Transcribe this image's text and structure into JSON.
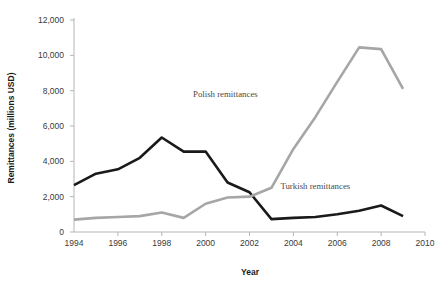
{
  "chart_data": {
    "type": "line",
    "title": "",
    "xlabel": "Year",
    "ylabel": "Remittances (millions USD)",
    "xlim": [
      1994,
      2010
    ],
    "ylim": [
      0,
      12000
    ],
    "xticks": [
      "1994",
      "1996",
      "1998",
      "2000",
      "2002",
      "2004",
      "2006",
      "2008",
      "2010"
    ],
    "xtick_values": [
      1994,
      1996,
      1998,
      2000,
      2002,
      2004,
      2006,
      2008,
      2010
    ],
    "yticks": [
      "0",
      "2,000",
      "4,000",
      "6,000",
      "8,000",
      "10,000",
      "12,000"
    ],
    "ytick_values": [
      0,
      2000,
      4000,
      6000,
      8000,
      10000,
      12000
    ],
    "grid": false,
    "legend_position": "inline-annotation",
    "x": [
      1994,
      1995,
      1996,
      1997,
      1998,
      1999,
      2000,
      2001,
      2002,
      2003,
      2004,
      2005,
      2006,
      2007,
      2008,
      2009
    ],
    "series": [
      {
        "name": "Turkish remittances",
        "color": "#1a1a1a",
        "linewidth": 2.6,
        "annotation": "Turkish remittances",
        "annotation_x": 2005.0,
        "annotation_y": 2450,
        "values": [
          2650,
          3300,
          3550,
          4200,
          5350,
          4550,
          4550,
          2800,
          2250,
          730,
          800,
          850,
          1000,
          1200,
          1500,
          900
        ]
      },
      {
        "name": "Polish remittances",
        "color": "#a6a6a6",
        "linewidth": 2.6,
        "annotation": "Polish remittances",
        "annotation_x": 2000.9,
        "annotation_y": 7650,
        "values": [
          700,
          800,
          850,
          900,
          1100,
          800,
          1600,
          1950,
          2000,
          2500,
          4700,
          6500,
          8500,
          10450,
          10350,
          8100
        ]
      }
    ]
  }
}
